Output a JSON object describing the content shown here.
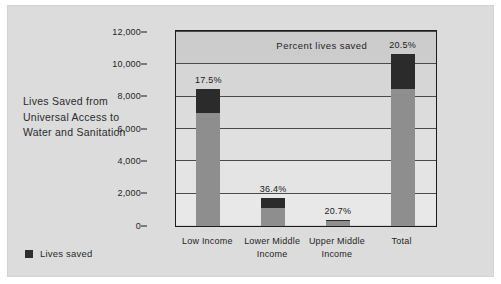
{
  "figure": {
    "caption": "Lives Saved from Universal Access to Water and Sanitation",
    "legend": {
      "swatch_name": "lives-saved-swatch",
      "label": "Lives saved"
    },
    "annotation": "Percent lives saved",
    "colors": {
      "panel_background": "#dcdcdc",
      "plot_background": "#d2d2d2",
      "bar_base": "#8e8e8e",
      "bar_saved": "#2b2b2b",
      "axis": "#1c1c1c",
      "gridline": "#4a4a4a",
      "text": "#1f1f1f"
    }
  },
  "chart_data": {
    "type": "bar",
    "title": "Lives Saved from Universal Access to Water and Sanitation",
    "xlabel": "",
    "ylabel": "",
    "ylim": [
      0,
      12000
    ],
    "grid": true,
    "legend_position": "left-bottom",
    "categories": [
      "Low Income",
      "Lower Middle Income",
      "Upper Middle Income",
      "Total"
    ],
    "ticks": [
      "0",
      "2,000",
      "4,000",
      "6,000",
      "8,000",
      "10,000",
      "12,000"
    ],
    "tick_values": [
      0,
      2000,
      4000,
      6000,
      8000,
      10000,
      12000
    ],
    "annotations": [
      "Percent lives saved"
    ],
    "series": [
      {
        "name": "Total lives",
        "values": [
          8450,
          1760,
          400,
          10650
        ]
      },
      {
        "name": "Lives saved",
        "values": [
          1479,
          641,
          83,
          2183
        ]
      }
    ],
    "data_labels": [
      "17.5%",
      "36.4%",
      "20.7%",
      "20.5%"
    ],
    "bars": [
      {
        "category": "Low Income",
        "total": 8450,
        "saved": 1479,
        "percent": "17.5%"
      },
      {
        "category": "Lower Middle Income",
        "total": 1760,
        "saved": 641,
        "percent": "36.4%"
      },
      {
        "category": "Upper Middle Income",
        "total": 400,
        "saved": 83,
        "percent": "20.7%"
      },
      {
        "category": "Total",
        "total": 10650,
        "saved": 2183,
        "percent": "20.5%"
      }
    ]
  }
}
